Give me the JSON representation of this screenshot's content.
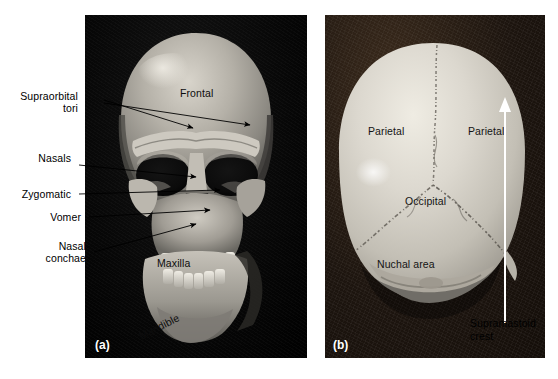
{
  "figure": {
    "type": "anatomical-photograph-figure",
    "background_color": "#ffffff"
  },
  "panels": [
    {
      "id": "a",
      "tag": "(a)",
      "view": "anterior (front) view of cranium and mandible",
      "background_color": "#050505",
      "bone_color": "#b9b5ad"
    },
    {
      "id": "b",
      "tag": "(b)",
      "view": "posterior (rear) view of cranial vault",
      "background_color": "#241a12",
      "bone_color": "#d5d2c9"
    }
  ],
  "panel_a": {
    "external_labels": [
      {
        "name": "supraorbital-tori",
        "line1": "Supraorbital",
        "line2": "tori"
      },
      {
        "name": "nasals",
        "line1": "Nasals",
        "line2": ""
      },
      {
        "name": "zygomatic",
        "line1": "Zygomatic",
        "line2": ""
      },
      {
        "name": "vomer",
        "line1": "Vomer",
        "line2": ""
      },
      {
        "name": "nasal-conchae",
        "line1": "Nasal",
        "line2": "conchae"
      }
    ],
    "overlay_labels": [
      {
        "name": "frontal",
        "text": "Frontal"
      },
      {
        "name": "maxilla",
        "text": "Maxilla"
      },
      {
        "name": "mandible",
        "text": "Mandible"
      }
    ]
  },
  "panel_b": {
    "overlay_labels": [
      {
        "name": "parietal-left",
        "text": "Parietal"
      },
      {
        "name": "parietal-right",
        "text": "Parietal"
      },
      {
        "name": "occipital",
        "text": "Occipital"
      },
      {
        "name": "nuchal-area",
        "text": "Nuchal area"
      }
    ],
    "external_labels": [
      {
        "name": "supramastoid-crest",
        "line1": "Supramastoid",
        "line2": "crest"
      }
    ],
    "arrow": {
      "name": "supramastoid-crest-arrow",
      "color": "#ffffff",
      "direction": "up"
    }
  },
  "colors": {
    "page_background": "#ffffff",
    "text": "#000000",
    "panel_tag_text": "#ffffff",
    "leader_line": "#000000",
    "arrow_white": "#ffffff"
  }
}
